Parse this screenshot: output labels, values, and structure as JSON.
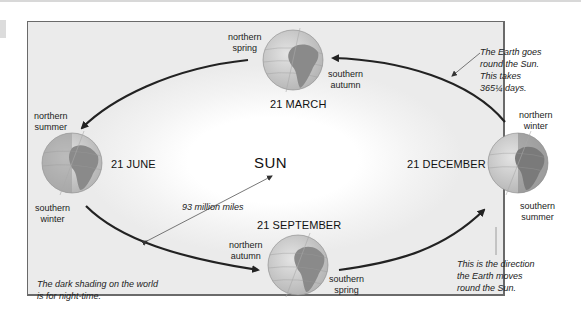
{
  "diagram": {
    "sun_label": "SUN",
    "distance_label": "93 million miles",
    "positions": [
      {
        "id": "march",
        "date": "21 MARCH",
        "northern": [
          "northern",
          "spring"
        ],
        "southern": [
          "southern",
          "autumn"
        ]
      },
      {
        "id": "june",
        "date": "21 JUNE",
        "northern": [
          "northern",
          "summer"
        ],
        "southern": [
          "southern",
          "winter"
        ]
      },
      {
        "id": "september",
        "date": "21 SEPTEMBER",
        "northern": [
          "northern",
          "autumn"
        ],
        "southern": [
          "southern",
          "spring"
        ]
      },
      {
        "id": "december",
        "date": "21 DECEMBER",
        "northern": [
          "northern",
          "winter"
        ],
        "southern": [
          "southern",
          "summer"
        ]
      }
    ],
    "notes": {
      "orbit_period": [
        "The Earth goes",
        "round the Sun.",
        "This takes",
        "365¼ days."
      ],
      "direction": [
        "This is the direction",
        "the Earth moves",
        "round the Sun."
      ],
      "night_shading": [
        "The dark shading on the world",
        "is for night-time."
      ]
    },
    "colors": {
      "frame_border": "#6a6a6a",
      "background": "#ececec",
      "orbit_line": "#222222",
      "globe_land": "#8a8a8a",
      "globe_ocean": "#d0d0d0"
    }
  }
}
